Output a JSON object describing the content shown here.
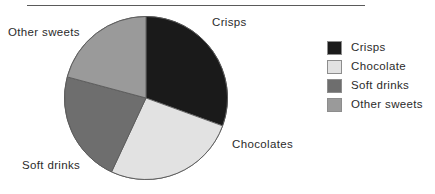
{
  "figure": {
    "background_color": "#ffffff",
    "rule_color": "#5a5a5a"
  },
  "chart_data": {
    "type": "pie",
    "title": "",
    "subtitle": "",
    "xlabel": "",
    "ylabel": "",
    "grid": false,
    "legend_position": "right",
    "start_angle_deg": 0,
    "direction": "clockwise",
    "categories": [
      "Crisps",
      "Chocolates",
      "Soft drinks",
      "Other sweets"
    ],
    "values": [
      30.5,
      26.5,
      22.0,
      21.0
    ],
    "units": "percent",
    "colors": [
      "#1a1a1a",
      "#e2e2e2",
      "#6e6e6e",
      "#9a9a9a"
    ],
    "slice_edge_color": "#5a5a5a",
    "slices": [
      {
        "label": "Crisps",
        "value": 30.5,
        "start_deg": 0,
        "end_deg": 110,
        "color": "#1a1a1a"
      },
      {
        "label": "Chocolates",
        "value": 26.5,
        "start_deg": 110,
        "end_deg": 205,
        "color": "#e2e2e2"
      },
      {
        "label": "Soft drinks",
        "value": 22.0,
        "start_deg": 205,
        "end_deg": 285,
        "color": "#6e6e6e"
      },
      {
        "label": "Other sweets",
        "value": 21.0,
        "start_deg": 285,
        "end_deg": 360,
        "color": "#9a9a9a"
      }
    ],
    "annotations": [
      {
        "text": "Crisps",
        "position": "upper-right"
      },
      {
        "text": "Chocolates",
        "position": "lower-right"
      },
      {
        "text": "Soft drinks",
        "position": "lower-left"
      },
      {
        "text": "Other sweets",
        "position": "upper-left"
      }
    ]
  },
  "pie_labels": {
    "crisps": "Crisps",
    "chocolates": "Chocolates",
    "soft_drinks": "Soft drinks",
    "other_sweets": "Other sweets"
  },
  "legend": {
    "items": [
      {
        "label": "Crisps",
        "color": "#1a1a1a"
      },
      {
        "label": "Chocolate",
        "color": "#e2e2e2"
      },
      {
        "label": "Soft drinks",
        "color": "#6e6e6e"
      },
      {
        "label": "Other sweets",
        "color": "#9a9a9a"
      }
    ]
  }
}
